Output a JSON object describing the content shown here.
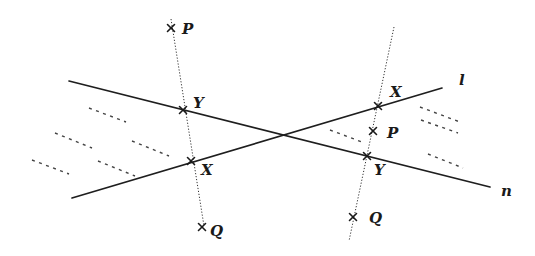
{
  "diagram": {
    "title": "",
    "lines": [
      {
        "id": "n",
        "label": "n",
        "x1": 69,
        "y1": 81,
        "x2": 490,
        "y2": 187,
        "label_x": 501,
        "label_y": 196
      },
      {
        "id": "l",
        "label": "l",
        "x1": 72,
        "y1": 198,
        "x2": 442,
        "y2": 88,
        "label_x": 459,
        "label_y": 85
      }
    ],
    "perpendiculars": [
      {
        "id": "left-dotted",
        "x1": 171,
        "y1": 19,
        "x2": 204,
        "y2": 226
      },
      {
        "id": "right-dotted",
        "x1": 394,
        "y1": 27,
        "x2": 349,
        "y2": 241
      }
    ],
    "points": [
      {
        "id": "left-P",
        "label": "P",
        "x": 171,
        "y": 28,
        "label_x": 182,
        "label_y": 34
      },
      {
        "id": "left-Y",
        "label": "Y",
        "x": 183,
        "y": 110,
        "label_x": 193,
        "label_y": 108
      },
      {
        "id": "left-X",
        "label": "X",
        "x": 191,
        "y": 161,
        "label_x": 201,
        "label_y": 175
      },
      {
        "id": "left-Q",
        "label": "Q",
        "x": 202,
        "y": 227,
        "label_x": 210,
        "label_y": 236
      },
      {
        "id": "right-X",
        "label": "X",
        "x": 378,
        "y": 106,
        "label_x": 390,
        "label_y": 97
      },
      {
        "id": "right-P",
        "label": "P",
        "x": 373,
        "y": 131,
        "label_x": 387,
        "label_y": 138
      },
      {
        "id": "right-Y",
        "label": "Y",
        "x": 367,
        "y": 156,
        "label_x": 374,
        "label_y": 175
      },
      {
        "id": "right-Q",
        "label": "Q",
        "x": 353,
        "y": 217,
        "label_x": 369,
        "label_y": 223
      }
    ],
    "hatch_marks": [
      {
        "x1": 89,
        "y1": 108,
        "x2": 126,
        "y2": 122
      },
      {
        "x1": 55,
        "y1": 133,
        "x2": 92,
        "y2": 148
      },
      {
        "x1": 132,
        "y1": 141,
        "x2": 169,
        "y2": 156
      },
      {
        "x1": 32,
        "y1": 160,
        "x2": 69,
        "y2": 174
      },
      {
        "x1": 98,
        "y1": 161,
        "x2": 135,
        "y2": 176
      },
      {
        "x1": 330,
        "y1": 130,
        "x2": 362,
        "y2": 142
      },
      {
        "x1": 420,
        "y1": 107,
        "x2": 460,
        "y2": 122
      },
      {
        "x1": 421,
        "y1": 120,
        "x2": 458,
        "y2": 133
      },
      {
        "x1": 428,
        "y1": 154,
        "x2": 463,
        "y2": 168
      }
    ]
  }
}
